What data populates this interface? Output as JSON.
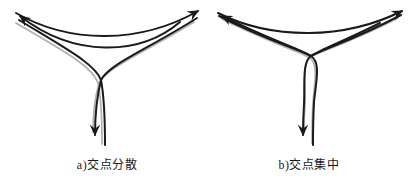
{
  "colors": {
    "background": "#ffffff",
    "ink": "#1a1a1a",
    "gray_line": "#b0b0b0"
  },
  "figures": [
    {
      "caption": "a)交点分散"
    },
    {
      "caption": "b)交点集中"
    }
  ]
}
